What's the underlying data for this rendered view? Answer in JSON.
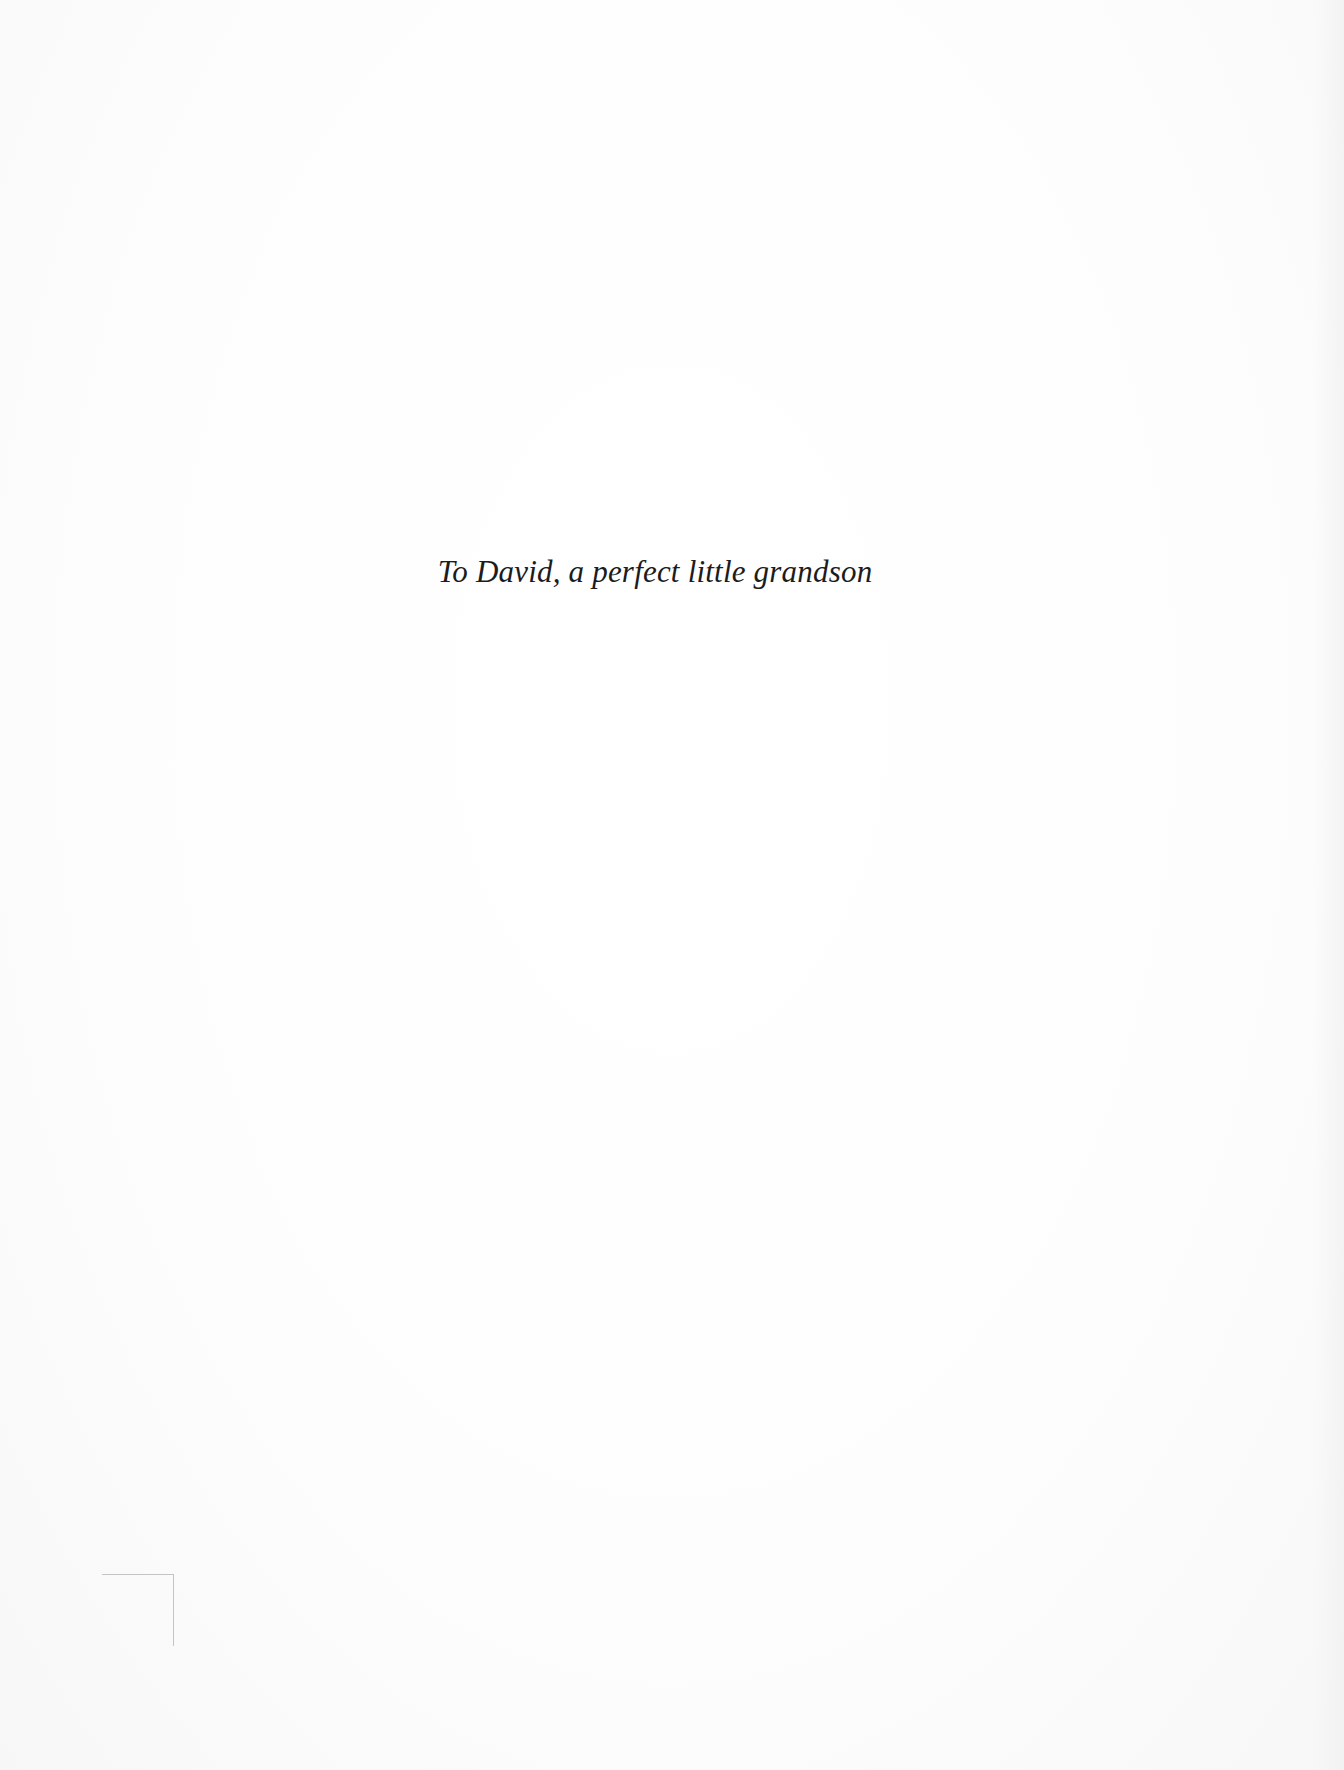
{
  "page": {
    "dedication": "To David, a perfect little grandson"
  },
  "colors": {
    "background": "#fdfdfd",
    "text": "#1c1c1c",
    "crop_mark": "#c4c4c4"
  }
}
